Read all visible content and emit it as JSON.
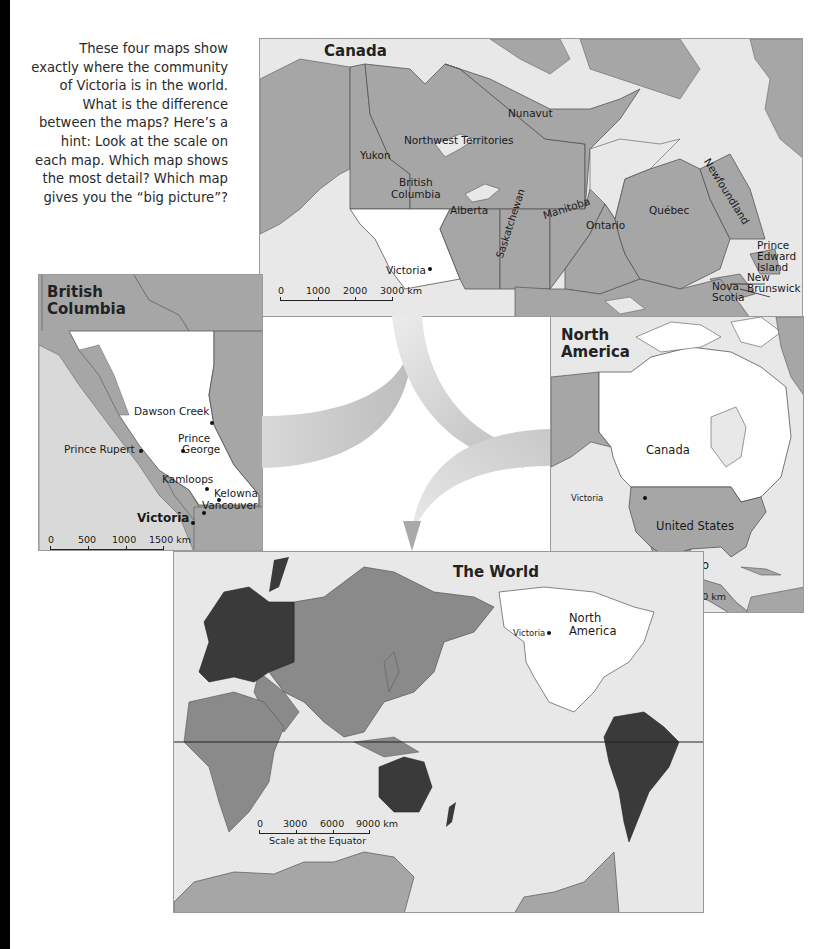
{
  "intro_text": "These four maps show exactly where the community of Victoria is in the world. What is the difference between the maps? Here’s a hint: Look at the scale on each map. Which map shows the most detail? Which map gives you the “big picture”?",
  "colors": {
    "land_gray": "#a6a6a6",
    "water": "#e8e8e8",
    "highlight_white": "#ffffff",
    "dark_region": "#3a3a3a",
    "mid_region": "#8a8a8a",
    "arrow": "#c4c4c4"
  },
  "maps": {
    "canada": {
      "title": "Canada",
      "labels": {
        "nunavut": "Nunavut",
        "nwt": "Northwest Territories",
        "yukon": "Yukon",
        "bc_line1": "British",
        "bc_line2": "Columbia",
        "alberta": "Alberta",
        "saskatchewan": "Saskatchewan",
        "manitoba": "Manitoba",
        "ontario": "Ontario",
        "quebec": "Québec",
        "newfoundland": "Newfoundland",
        "pei_line1": "Prince",
        "pei_line2": "Edward",
        "pei_line3": "Island",
        "nb_line1": "New",
        "nb_line2": "Brunswick",
        "ns_line1": "Nova",
        "ns_line2": "Scotia",
        "victoria": "Victoria"
      },
      "scale": {
        "ticks": [
          "0",
          "1000",
          "2000",
          "3000 km"
        ]
      }
    },
    "british_columbia": {
      "title_line1": "British",
      "title_line2": "Columbia",
      "cities": {
        "dawson_creek": "Dawson Creek",
        "prince_george_line1": "Prince",
        "prince_george_line2": "George",
        "prince_rupert": "Prince Rupert",
        "kamloops": "Kamloops",
        "kelowna": "Kelowna",
        "vancouver": "Vancouver",
        "victoria": "Victoria"
      },
      "scale": {
        "ticks": [
          "0",
          "500",
          "1000",
          "1500 km"
        ]
      }
    },
    "north_america": {
      "title_line1": "North",
      "title_line2": "America",
      "labels": {
        "canada": "Canada",
        "united_states": "United States",
        "mexico": "Mexico",
        "victoria": "Victoria"
      },
      "scale": {
        "ticks": [
          "0",
          "2000",
          "4000",
          "6000 km"
        ]
      }
    },
    "world": {
      "title": "The World",
      "labels": {
        "north_america_line1": "North",
        "north_america_line2": "America",
        "victoria": "Victoria"
      },
      "scale": {
        "ticks": [
          "0",
          "3000",
          "6000",
          "9000 km"
        ],
        "caption": "Scale at the Equator"
      }
    }
  }
}
